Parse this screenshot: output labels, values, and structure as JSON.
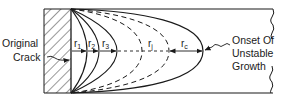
{
  "diagram": {
    "title": "",
    "labels": {
      "original_crack_line1": "Original",
      "original_crack_line2": "Crack",
      "onset_line1": "Onset Of",
      "onset_line2": "Unstable",
      "onset_line3": "Growth"
    },
    "radii": [
      {
        "symbol": "r",
        "sub": "1",
        "style": "solid"
      },
      {
        "symbol": "r",
        "sub": "2",
        "style": "solid"
      },
      {
        "symbol": "r",
        "sub": "3",
        "style": "solid"
      },
      {
        "symbol": "r",
        "sub": "j",
        "style": "dashed"
      },
      {
        "symbol": "r",
        "sub": "c",
        "style": "solid"
      }
    ],
    "colors": {
      "stroke": "#1a1a1a",
      "background": "#ffffff"
    }
  }
}
